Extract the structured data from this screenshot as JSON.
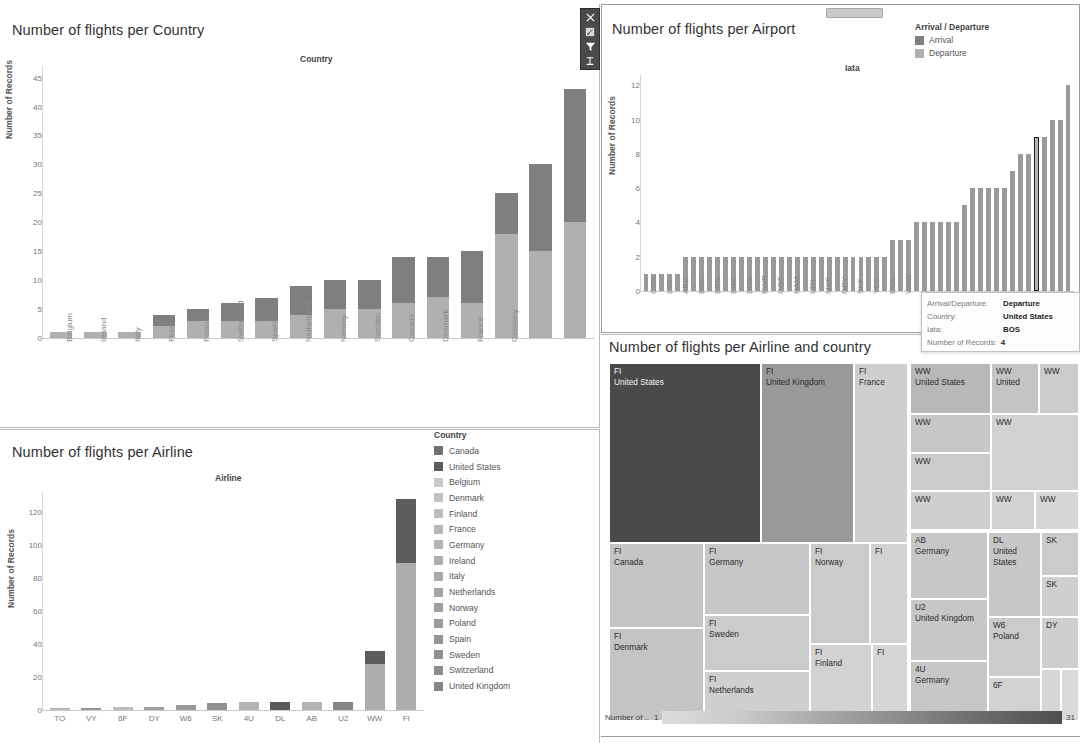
{
  "dashboard": {
    "toolbar_icons": [
      "close-icon",
      "keep-only-icon",
      "exclude-filter-icon",
      "sort-icon"
    ]
  },
  "country_panel": {
    "title": "Number of flights per Country",
    "field_title": "Country",
    "y_label": "Number of Records"
  },
  "airport_panel": {
    "title": "Number of flights per Airport",
    "field_title": "Iata",
    "y_label": "Number of Records",
    "legend_title": "Arrival / Departure",
    "legend": [
      {
        "label": "Arrival",
        "color": "#7f7f7f"
      },
      {
        "label": "Departure",
        "color": "#b0b0b0"
      }
    ]
  },
  "tooltip": {
    "rows": [
      {
        "key": "Arrival/Departure:",
        "value": "Departure"
      },
      {
        "key": "Country:",
        "value": "United States"
      },
      {
        "key": "Iata:",
        "value": "BOS"
      },
      {
        "key": "Number of Records:",
        "value": "4"
      }
    ]
  },
  "airline_panel": {
    "title": "Number of flights per Airline",
    "field_title": "Airline",
    "y_label": "Number of Records",
    "legend_title": "Country"
  },
  "treemap_panel": {
    "title": "Number of flights per Airline and country",
    "legend_title": "Number of ..",
    "legend_min": "1",
    "legend_max": "31"
  },
  "chart_data": [
    {
      "type": "bar",
      "title": "Number of flights per Country",
      "xlabel": "Country",
      "ylabel": "Number of Records",
      "ylim": [
        0,
        47
      ],
      "yticks": [
        0,
        5,
        10,
        15,
        20,
        25,
        30,
        35,
        40,
        45
      ],
      "stacked": true,
      "categories": [
        "Belgium",
        "Ireland",
        "Italy",
        "Finland",
        "Poland",
        "Switzerland",
        "Spain",
        "Netherlands",
        "Norway",
        "Sweden",
        "Canada",
        "Denmark",
        "France",
        "Germany",
        "United Kingdom",
        "United States"
      ],
      "series": [
        {
          "name": "Departure",
          "values": [
            1,
            1,
            1,
            2,
            3,
            3,
            3,
            4,
            5,
            5,
            6,
            7,
            6,
            18,
            15,
            20
          ]
        },
        {
          "name": "Arrival",
          "values": [
            0,
            0,
            0,
            2,
            2,
            3,
            4,
            5,
            5,
            5,
            8,
            7,
            9,
            7,
            15,
            23
          ]
        }
      ],
      "totals": [
        1,
        1,
        1,
        4,
        5,
        6,
        7,
        9,
        10,
        10,
        14,
        14,
        15,
        25,
        30,
        43
      ]
    },
    {
      "type": "bar",
      "title": "Number of flights per Airport",
      "xlabel": "Iata",
      "ylabel": "Number of Records",
      "ylim": [
        0,
        12.6
      ],
      "yticks": [
        0,
        2,
        4,
        6,
        8,
        10,
        12
      ],
      "tick_labels": [
        "CGN",
        "LYS",
        "ARZ",
        "BGO",
        "BRS",
        "BHX",
        "DUB",
        "EWR",
        "GOT",
        "HAM",
        "LTN",
        "MXP",
        "ORY",
        "SXF",
        "YEG",
        "BCN",
        "WAW"
      ],
      "values": [
        1,
        1,
        1,
        1,
        1,
        2,
        2,
        2,
        2,
        2,
        2,
        2,
        2,
        2,
        2,
        2,
        2,
        2,
        2,
        2,
        2,
        2,
        2,
        2,
        2,
        2,
        2,
        2,
        2,
        2,
        2,
        3,
        3,
        3,
        4,
        4,
        4,
        4,
        4,
        4,
        5,
        6,
        6,
        6,
        6,
        6,
        7,
        8,
        8,
        9,
        9,
        10,
        10,
        12
      ],
      "selected_index": 49,
      "selected_value": 4
    },
    {
      "type": "bar",
      "title": "Number of flights per Airline",
      "xlabel": "Airline",
      "ylabel": "Number of Records",
      "ylim": [
        0,
        132
      ],
      "yticks": [
        0,
        20,
        40,
        60,
        80,
        100,
        120
      ],
      "stacked": true,
      "categories": [
        "TO",
        "VY",
        "6F",
        "DY",
        "W6",
        "SK",
        "4U",
        "DL",
        "AB",
        "U2",
        "WW",
        "FI"
      ],
      "totals": [
        1,
        1,
        2,
        2,
        3,
        4,
        5,
        5,
        5,
        5,
        36,
        128
      ],
      "stacks": [
        {
          "category": "TO",
          "segments": [
            {
              "country": "France",
              "value": 1
            }
          ]
        },
        {
          "category": "VY",
          "segments": [
            {
              "country": "Spain",
              "value": 1
            }
          ]
        },
        {
          "category": "6F",
          "segments": [
            {
              "country": "Finland",
              "value": 2
            }
          ]
        },
        {
          "category": "DY",
          "segments": [
            {
              "country": "Norway",
              "value": 2
            }
          ]
        },
        {
          "category": "W6",
          "segments": [
            {
              "country": "Poland",
              "value": 3
            }
          ]
        },
        {
          "category": "SK",
          "segments": [
            {
              "country": "Sweden",
              "value": 4
            }
          ]
        },
        {
          "category": "4U",
          "segments": [
            {
              "country": "Germany",
              "value": 5
            }
          ]
        },
        {
          "category": "DL",
          "segments": [
            {
              "country": "United States",
              "value": 5
            }
          ]
        },
        {
          "category": "AB",
          "segments": [
            {
              "country": "Germany",
              "value": 5
            }
          ]
        },
        {
          "category": "U2",
          "segments": [
            {
              "country": "United Kingdom",
              "value": 5
            }
          ]
        },
        {
          "category": "WW",
          "segments": [
            {
              "country": "other",
              "value": 28
            },
            {
              "country": "United States",
              "value": 8
            }
          ]
        },
        {
          "category": "FI",
          "segments": [
            {
              "country": "other",
              "value": 89
            },
            {
              "country": "United States",
              "value": 39
            }
          ]
        }
      ],
      "legend_title": "Country",
      "legend": [
        {
          "label": "Canada",
          "color": "#6f6f6f"
        },
        {
          "label": "United States",
          "color": "#5c5c5c"
        },
        {
          "label": "Belgium",
          "color": "#c9c9c9"
        },
        {
          "label": "Denmark",
          "color": "#c2c2c2"
        },
        {
          "label": "Finland",
          "color": "#bdbdbd"
        },
        {
          "label": "France",
          "color": "#b8b8b8"
        },
        {
          "label": "Germany",
          "color": "#b3b3b3"
        },
        {
          "label": "Ireland",
          "color": "#aeaeae"
        },
        {
          "label": "Italy",
          "color": "#a9a9a9"
        },
        {
          "label": "Netherlands",
          "color": "#a4a4a4"
        },
        {
          "label": "Norway",
          "color": "#9f9f9f"
        },
        {
          "label": "Poland",
          "color": "#9a9a9a"
        },
        {
          "label": "Spain",
          "color": "#959595"
        },
        {
          "label": "Sweden",
          "color": "#909090"
        },
        {
          "label": "Switzerland",
          "color": "#8b8b8b"
        },
        {
          "label": "United Kingdom",
          "color": "#868686"
        }
      ]
    },
    {
      "type": "treemap",
      "title": "Number of flights per Airline and country",
      "color_label": "Number of ..",
      "color_range": [
        1,
        31
      ],
      "tiles": [
        {
          "airline": "FI",
          "country": "United States",
          "x": 0,
          "y": 0,
          "w": 152,
          "h": 180,
          "color": "#4a4a4a",
          "dark": true
        },
        {
          "airline": "FI",
          "country": "United Kingdom",
          "x": 152,
          "y": 0,
          "w": 93,
          "h": 180,
          "color": "#999999",
          "dark": false
        },
        {
          "airline": "FI",
          "country": "France",
          "x": 245,
          "y": 0,
          "w": 54,
          "h": 180,
          "color": "#cfcfcf",
          "dark": false
        },
        {
          "airline": "FI",
          "country": "Canada",
          "x": 0,
          "y": 180,
          "w": 95,
          "h": 85,
          "color": "#c4c4c4",
          "dark": false
        },
        {
          "airline": "FI",
          "country": "Denmark",
          "x": 0,
          "y": 265,
          "w": 95,
          "h": 93,
          "color": "#c4c4c4",
          "dark": false
        },
        {
          "airline": "FI",
          "country": "Germany",
          "x": 95,
          "y": 180,
          "w": 106,
          "h": 72,
          "color": "#c7c7c7",
          "dark": false
        },
        {
          "airline": "FI",
          "country": "Sweden",
          "x": 95,
          "y": 252,
          "w": 106,
          "h": 56,
          "color": "#cbcbcb",
          "dark": false
        },
        {
          "airline": "FI",
          "country": "Netherlands",
          "x": 95,
          "y": 308,
          "w": 106,
          "h": 50,
          "color": "#cfcfcf",
          "dark": false
        },
        {
          "airline": "FI",
          "country": "Norway",
          "x": 201,
          "y": 180,
          "w": 60,
          "h": 101,
          "color": "#cbcbcb",
          "dark": false
        },
        {
          "airline": "FI",
          "country": "",
          "x": 261,
          "y": 180,
          "w": 38,
          "h": 101,
          "color": "#d2d2d2",
          "dark": false
        },
        {
          "airline": "FI",
          "country": "Finland",
          "x": 201,
          "y": 281,
          "w": 62,
          "h": 77,
          "color": "#d2d2d2",
          "dark": false
        },
        {
          "airline": "FI",
          "country": "",
          "x": 263,
          "y": 281,
          "w": 36,
          "h": 77,
          "color": "#d6d6d6",
          "dark": false
        },
        {
          "airline": "WW",
          "country": "United States",
          "x": 301,
          "y": 0,
          "w": 81,
          "h": 51,
          "color": "#b8b8b8",
          "dark": false
        },
        {
          "airline": "WW",
          "country": "United",
          "x": 382,
          "y": 0,
          "w": 48,
          "h": 51,
          "color": "#c4c4c4",
          "dark": false
        },
        {
          "airline": "WW",
          "country": "",
          "x": 430,
          "y": 0,
          "w": 40,
          "h": 51,
          "color": "#cbcbcb",
          "dark": false
        },
        {
          "airline": "WW",
          "country": "",
          "x": 301,
          "y": 51,
          "w": 81,
          "h": 39,
          "color": "#c7c7c7",
          "dark": false
        },
        {
          "airline": "WW",
          "country": "",
          "x": 301,
          "y": 90,
          "w": 81,
          "h": 38,
          "color": "#cbcbcb",
          "dark": false
        },
        {
          "airline": "WW",
          "country": "",
          "x": 301,
          "y": 128,
          "w": 81,
          "h": 39,
          "color": "#cfcfcf",
          "dark": false
        },
        {
          "airline": "WW",
          "country": "",
          "x": 382,
          "y": 51,
          "w": 88,
          "h": 77,
          "color": "#d2d2d2",
          "dark": false
        },
        {
          "airline": "WW",
          "country": "",
          "x": 382,
          "y": 128,
          "w": 44,
          "h": 39,
          "color": "#d2d2d2",
          "dark": false
        },
        {
          "airline": "WW",
          "country": "",
          "x": 426,
          "y": 128,
          "w": 44,
          "h": 39,
          "color": "#d6d6d6",
          "dark": false
        },
        {
          "airline": "AB",
          "country": "Germany",
          "x": 301,
          "y": 169,
          "w": 78,
          "h": 67,
          "color": "#c7c7c7",
          "dark": false
        },
        {
          "airline": "U2",
          "country": "United Kingdom",
          "x": 301,
          "y": 236,
          "w": 78,
          "h": 62,
          "color": "#c7c7c7",
          "dark": false
        },
        {
          "airline": "4U",
          "country": "Germany",
          "x": 301,
          "y": 298,
          "w": 78,
          "h": 60,
          "color": "#c7c7c7",
          "dark": false
        },
        {
          "airline": "DL",
          "country": "United States",
          "x": 379,
          "y": 169,
          "w": 53,
          "h": 85,
          "color": "#c7c7c7",
          "dark": false
        },
        {
          "airline": "W6",
          "country": "Poland",
          "x": 379,
          "y": 254,
          "w": 53,
          "h": 60,
          "color": "#cbcbcb",
          "dark": false
        },
        {
          "airline": "6F",
          "country": "",
          "x": 379,
          "y": 314,
          "w": 53,
          "h": 44,
          "color": "#d2d2d2",
          "dark": false
        },
        {
          "airline": "SK",
          "country": "",
          "x": 432,
          "y": 169,
          "w": 38,
          "h": 44,
          "color": "#cbcbcb",
          "dark": false
        },
        {
          "airline": "SK",
          "country": "",
          "x": 432,
          "y": 213,
          "w": 38,
          "h": 41,
          "color": "#cfcfcf",
          "dark": false
        },
        {
          "airline": "DY",
          "country": "",
          "x": 432,
          "y": 254,
          "w": 38,
          "h": 52,
          "color": "#cfcfcf",
          "dark": false
        },
        {
          "airline": "",
          "country": "",
          "x": 432,
          "y": 306,
          "w": 20,
          "h": 52,
          "color": "#d6d6d6",
          "dark": false
        },
        {
          "airline": "",
          "country": "",
          "x": 452,
          "y": 306,
          "w": 18,
          "h": 52,
          "color": "#dadada",
          "dark": false
        }
      ]
    }
  ]
}
